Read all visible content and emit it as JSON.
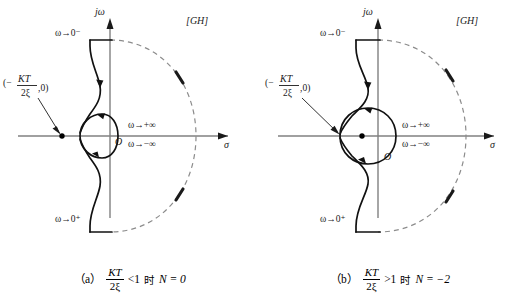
{
  "figure": {
    "background": "#ffffff",
    "axis_color": "#808080",
    "curve_color": "#000000",
    "dash_color": "#808080"
  },
  "panels": [
    {
      "id": "a",
      "plane_label": "[GH]",
      "axis_imag_label": "jω",
      "axis_real_label": "σ",
      "origin_label": "O",
      "point_label_parts": {
        "open": "(−",
        "numerator": "KT",
        "denominator": "2ξ",
        "close": ",0)"
      },
      "omega_top": "ω→0⁻",
      "omega_bottom": "ω→0⁺",
      "omega_plus_inf": "ω→+∞",
      "omega_minus_inf": "ω→−∞",
      "critical_point_inside_loop": false,
      "caption": {
        "tag": "（a）",
        "numerator": "KT",
        "denominator": "2ξ",
        "relation": "<1",
        "cn": "时",
        "result": "N = 0"
      }
    },
    {
      "id": "b",
      "plane_label": "[GH]",
      "axis_imag_label": "jω",
      "axis_real_label": "σ",
      "origin_label": "O",
      "point_label_parts": {
        "open": "(−",
        "numerator": "KT",
        "denominator": "2ξ",
        "close": ",0)"
      },
      "omega_top": "ω→0⁻",
      "omega_bottom": "ω→0⁺",
      "omega_plus_inf": "ω→+∞",
      "omega_minus_inf": "ω→−∞",
      "critical_point_inside_loop": true,
      "caption": {
        "tag": "（b）",
        "numerator": "KT",
        "denominator": "2ξ",
        "relation": ">1",
        "cn": "时",
        "result": "N = −2"
      }
    }
  ]
}
